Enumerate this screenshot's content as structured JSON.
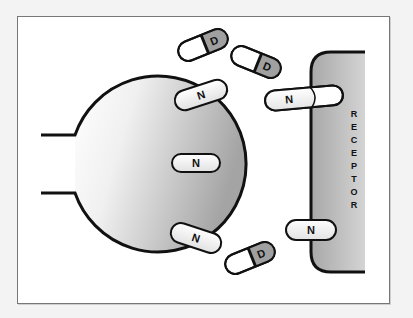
{
  "diagram": {
    "type": "receptor-binding-illustration",
    "receptor": {
      "label": "RECEPTOR",
      "letters": [
        "R",
        "E",
        "C",
        "E",
        "P",
        "T",
        "O",
        "R"
      ]
    },
    "cell_body": {
      "label": ""
    },
    "pills_N": [
      {
        "label": "N",
        "position": "cell-top-edge"
      },
      {
        "label": "N",
        "position": "cell-center"
      },
      {
        "label": "N",
        "position": "cell-bottom-edge"
      },
      {
        "label": "N",
        "position": "receptor-top-bound"
      },
      {
        "label": "N",
        "position": "receptor-bottom-bound"
      }
    ],
    "pills_D": [
      {
        "label": "D",
        "position": "free-top-left"
      },
      {
        "label": "D",
        "position": "free-top-right"
      },
      {
        "label": "D",
        "position": "free-bottom"
      }
    ],
    "colors": {
      "outline": "#111111",
      "frame_border": "#777777",
      "receptor_fill_light": "#d8d8d8",
      "receptor_fill_dark": "#9a9a9a",
      "cell_fill_light": "#ffffff",
      "cell_fill_dark": "#a8a8a8",
      "pill_white": "#ffffff",
      "pill_gray": "#a0a0a0",
      "pill_N_fill": "#eeeeee"
    }
  }
}
